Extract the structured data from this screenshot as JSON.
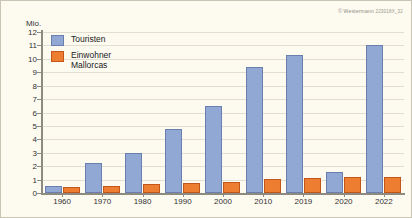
{
  "credit": {
    "text": "© Westermann",
    "code": "223018X_32"
  },
  "chart_data": {
    "type": "bar",
    "title": "",
    "xlabel": "",
    "ylabel": "Mio.",
    "ylim": [
      0,
      12
    ],
    "yticks": [
      0,
      1,
      2,
      3,
      4,
      5,
      6,
      7,
      8,
      9,
      10,
      11,
      12
    ],
    "grid": true,
    "legend_position": "top-left",
    "categories": [
      "1960",
      "1970",
      "1980",
      "1990",
      "2000",
      "2010",
      "2019",
      "2020",
      "2022"
    ],
    "series": [
      {
        "name": "Touristen",
        "color": "#92a8d4",
        "values": [
          0.5,
          2.2,
          3.0,
          4.8,
          6.5,
          9.4,
          10.3,
          1.6,
          11.0
        ]
      },
      {
        "name": "Einwohner Mallorcas",
        "color": "#ed7d31",
        "values": [
          0.44,
          0.55,
          0.64,
          0.71,
          0.79,
          1.07,
          1.15,
          1.17,
          1.2
        ]
      }
    ]
  },
  "legend": {
    "items": [
      {
        "label": "Touristen"
      },
      {
        "label": "Einwohner\nMallorcas"
      }
    ]
  }
}
